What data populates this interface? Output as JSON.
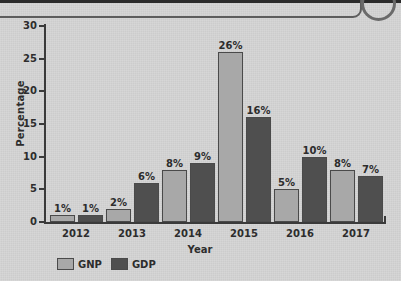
{
  "chart_data": {
    "type": "bar",
    "title": "",
    "xlabel": "Year",
    "ylabel": "Percentage",
    "categories": [
      "2012",
      "2013",
      "2014",
      "2015",
      "2016",
      "2017"
    ],
    "series": [
      {
        "name": "GNP",
        "color": "#a8a8a8",
        "values": [
          1,
          2,
          8,
          26,
          5,
          8
        ],
        "value_labels": [
          "1%",
          "2%",
          "8%",
          "26%",
          "5%",
          "8%"
        ]
      },
      {
        "name": "GDP",
        "color": "#4f4f4f",
        "values": [
          1,
          6,
          9,
          16,
          10,
          7
        ],
        "value_labels": [
          "1%",
          "6%",
          "9%",
          "16%",
          "10%",
          "7%"
        ]
      }
    ],
    "ylim": [
      0,
      30
    ],
    "yticks": [
      0,
      5,
      10,
      15,
      20,
      25,
      30
    ],
    "ytick_labels": [
      "0",
      "5",
      "10",
      "15",
      "20",
      "25",
      "30"
    ],
    "grid": false,
    "legend_position": "bottom-left",
    "value_labels_shown": true
  },
  "axes": {
    "y_title": "Percentage",
    "x_title": "Year",
    "y_ticks": [
      "30",
      "25",
      "20",
      "15",
      "10",
      "5",
      "0"
    ]
  },
  "legend": {
    "items": [
      {
        "label": "GNP",
        "color": "#a8a8a8"
      },
      {
        "label": "GDP",
        "color": "#4f4f4f"
      }
    ]
  },
  "colors": {
    "background": "#d4d4d4",
    "axis": "#3a3a3a",
    "text": "#2d2d2d",
    "gnp": "#a8a8a8",
    "gdp": "#4f4f4f"
  }
}
